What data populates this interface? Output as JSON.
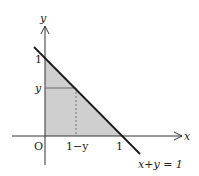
{
  "diagram": {
    "axes": {
      "x_label": "x",
      "y_label": "y",
      "origin_label": "O"
    },
    "ticks": {
      "x_one": "1",
      "y_one": "1",
      "y_var": "y",
      "x_var": "1−y"
    },
    "line_label": "x+y = 1",
    "colors": {
      "fill": "#cfcfcf",
      "line": "#1a1a1a",
      "axis": "#333333",
      "dash": "#777777"
    }
  }
}
